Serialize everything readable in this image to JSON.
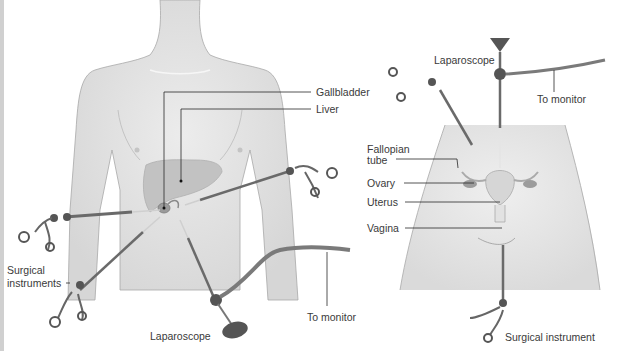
{
  "left_panel": {
    "labels": {
      "gallbladder": "Gallbladder",
      "liver": "Liver",
      "surgical_instruments_1": "Surgical",
      "surgical_instruments_2": "instruments",
      "laparoscope": "Laparoscope",
      "to_monitor": "To monitor"
    }
  },
  "right_panel": {
    "labels": {
      "laparoscope": "Laparoscope",
      "to_monitor": "To monitor",
      "fallopian_tube_1": "Fallopian",
      "fallopian_tube_2": "tube",
      "ovary": "Ovary",
      "uterus": "Uterus",
      "vagina": "Vagina",
      "surgical_instrument": "Surgical instrument"
    }
  },
  "colors": {
    "skin": "#e4e4e4",
    "skin_outline": "#9a9a9a",
    "organ": "#c8c8c8",
    "organ_dark": "#a9a9a9",
    "instrument": "#6e6e6e",
    "instrument_dark": "#444444",
    "leader": "#2a2a2a",
    "text": "#3a3a3a"
  }
}
